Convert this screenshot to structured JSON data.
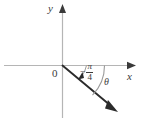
{
  "figure": {
    "type": "coordinate-plane-angle-diagram",
    "axes": {
      "x_label": "x",
      "y_label": "y",
      "origin_label": "0",
      "x_axis_color": "#b5b5b5",
      "y_axis_color": "#b5b5b5"
    },
    "angle": {
      "theta_label": "θ",
      "value_sign": "−",
      "value_numerator": "π",
      "value_denominator": "4",
      "value_text": "−π/4",
      "direction": "clockwise",
      "arc_color": "#9a9a9a"
    },
    "ray": {
      "color": "#2b2b2b",
      "terminal_side": true
    },
    "background_color": "#ffffff"
  }
}
